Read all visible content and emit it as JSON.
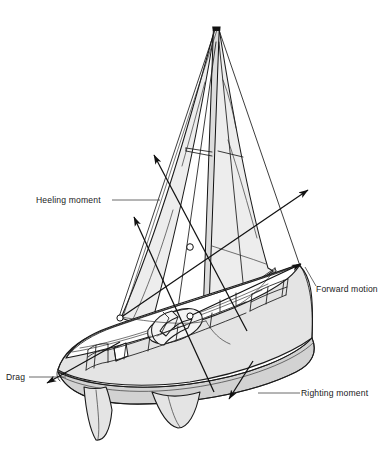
{
  "figure": {
    "background_color": "#ffffff",
    "line_color": "#1a1a1a",
    "sail_fill": "#ededed",
    "hull_fill": "#e4e4e4",
    "hull_shadow_fill": "#d2d2d2",
    "width": 389,
    "height": 462
  },
  "labels": {
    "heeling_moment": "Heeling moment",
    "forward_motion": "Forward motion",
    "drag": "Drag",
    "righting_moment": "Righting moment"
  },
  "arrows": [
    {
      "id": "heeling-upper",
      "label": "Heeling moment",
      "direction": "up-left",
      "tail_x": 247,
      "tail_y": 331,
      "tip_x": 152,
      "tip_y": 152
    },
    {
      "id": "heeling-lower",
      "label": "Heeling moment",
      "direction": "up-left",
      "tail_x": 214,
      "tail_y": 392,
      "tip_x": 132,
      "tip_y": 214
    },
    {
      "id": "forward-motion",
      "label": "Forward motion",
      "direction": "up-right",
      "tail_x": 120,
      "tail_y": 318,
      "tip_x": 310,
      "tip_y": 188
    },
    {
      "id": "forward-motion-stern",
      "label": "Forward motion",
      "direction": "up-right",
      "tail_x": 190,
      "tail_y": 316,
      "tip_x": 303,
      "tip_y": 262
    },
    {
      "id": "drag",
      "label": "Drag",
      "direction": "down-left",
      "tail_x": 120,
      "tail_y": 342,
      "tip_x": 45,
      "tip_y": 384
    },
    {
      "id": "righting-moment",
      "label": "Righting moment",
      "direction": "down-left",
      "tail_x": 253,
      "tail_y": 361,
      "tip_x": 228,
      "tip_y": 401
    }
  ],
  "parts": {
    "mainsail": "mainsail",
    "jib": "jib",
    "mast": "mast",
    "boom": "boom",
    "spreader": "spreader",
    "hull": "hull",
    "keel": "keel",
    "rudder": "rudder",
    "cockpit": "cockpit",
    "cabin": "cabin-trunk",
    "bow_pulpit": "bow-pulpit",
    "stern_pulpit": "stern-pulpit",
    "lifelines": "lifelines",
    "forestay": "forestay",
    "backstay": "backstay"
  }
}
